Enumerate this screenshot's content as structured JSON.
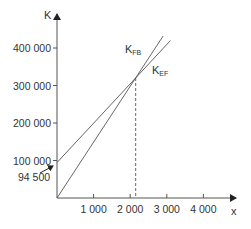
{
  "chart_data": {
    "type": "line",
    "title": "",
    "xlabel": "x",
    "ylabel": "K",
    "xlim": [
      0,
      4500
    ],
    "ylim": [
      0,
      430000
    ],
    "grid": false,
    "x_ticks": [
      1000,
      2000,
      3000,
      4000
    ],
    "x_tick_labels": [
      "1 000",
      "2 000",
      "3 000",
      "4 000"
    ],
    "y_ticks": [
      100000,
      200000,
      300000,
      400000
    ],
    "y_tick_labels": [
      "100 000",
      "200 000",
      "300 000",
      "400 000"
    ],
    "series": [
      {
        "name": "K_FB",
        "label_main": "K",
        "label_sub": "FB",
        "x": [
          0,
          2900
        ],
        "y": [
          0,
          432000
        ]
      },
      {
        "name": "K_EF",
        "label_main": "K",
        "label_sub": "EF",
        "x": [
          0,
          3100
        ],
        "y": [
          94500,
          420000
        ]
      }
    ],
    "annotations": [
      {
        "text": "94 500",
        "type": "arrow-label",
        "points_to": [
          0,
          94500
        ]
      },
      {
        "type": "dashed-vertical",
        "x": 2150,
        "y_top": 320000
      }
    ]
  }
}
